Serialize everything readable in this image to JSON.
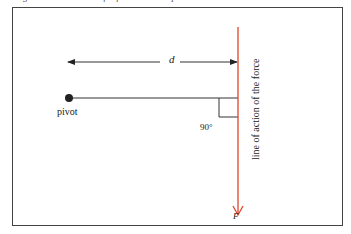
{
  "caption": "Figure 5.10 Moment of a force about a pivot",
  "diagram": {
    "distance_label": "d",
    "pivot_label": "pivot",
    "angle_label": "90°",
    "line_of_action_label": "line of action of the force",
    "force_label": "F",
    "colors": {
      "force_line": "#e0442c",
      "lines": "#333333",
      "frame": "#444444"
    }
  }
}
